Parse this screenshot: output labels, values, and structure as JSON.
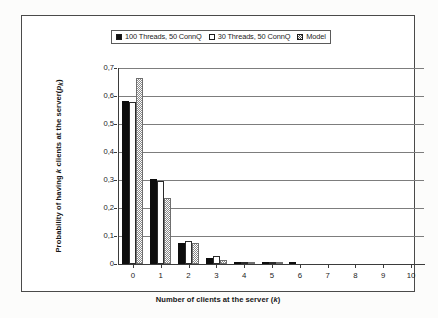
{
  "figure": {
    "background_color": "#ffffff",
    "frame_color": "#4a4a4a"
  },
  "legend": {
    "position": "top-center",
    "entries": [
      {
        "label": "100 Threads, 50 ConnQ",
        "swatch": "filled-black-square",
        "color": "#111111"
      },
      {
        "label": "30 Threads, 50 ConnQ",
        "swatch": "open-white-square",
        "color": "#ffffff"
      },
      {
        "label": "Model",
        "swatch": "checkered-gray-square",
        "color": "#8a8a8a"
      }
    ]
  },
  "axes": {
    "y_tick_labels": [
      "0,7",
      "0,6",
      "0,5",
      "0,4",
      "0,3",
      "0,2",
      "0,1",
      "0"
    ],
    "x_tick_labels": [
      "0",
      "1",
      "2",
      "3",
      "4",
      "5",
      "6",
      "7",
      "8",
      "9",
      "10"
    ],
    "y_title_part1": "Probability of having",
    "y_title_k": "k",
    "y_title_part2": "clients at the",
    "y_title_part3": "server(",
    "y_title_p": "p",
    "y_title_sub": "k",
    "y_title_part4": ")",
    "x_title_part1": "Number of clients at the server (",
    "x_title_k": "k",
    "x_title_part2": ")"
  },
  "chart_data": {
    "type": "bar",
    "title": "",
    "xlabel": "Number of clients at the server (k)",
    "ylabel": "Probability of having k clients at the server( p_k )",
    "categories": [
      "0",
      "1",
      "2",
      "3",
      "4",
      "5",
      "6",
      "7",
      "8",
      "9",
      "10"
    ],
    "series": [
      {
        "name": "100 Threads, 50 ConnQ",
        "fill": "solid-black",
        "values": [
          0.582,
          0.305,
          0.076,
          0.021,
          0.005,
          0.001,
          0.001,
          0.0,
          0.0,
          0.0,
          0.0
        ]
      },
      {
        "name": "30 Threads, 50 ConnQ",
        "fill": "open-white",
        "values": [
          0.577,
          0.298,
          0.083,
          0.029,
          0.008,
          0.002,
          0.0,
          0.0,
          0.0,
          0.0,
          0.0
        ]
      },
      {
        "name": "Model",
        "fill": "checkered-gray",
        "values": [
          0.663,
          0.234,
          0.075,
          0.016,
          0.004,
          0.001,
          0.0,
          0.0,
          0.0,
          0.0,
          0.0
        ]
      }
    ],
    "ylim": [
      0,
      0.7
    ],
    "y_tick_step": 0.1,
    "grid": "horizontal-only",
    "legend_position": "top-center",
    "decimal_separator": ","
  }
}
